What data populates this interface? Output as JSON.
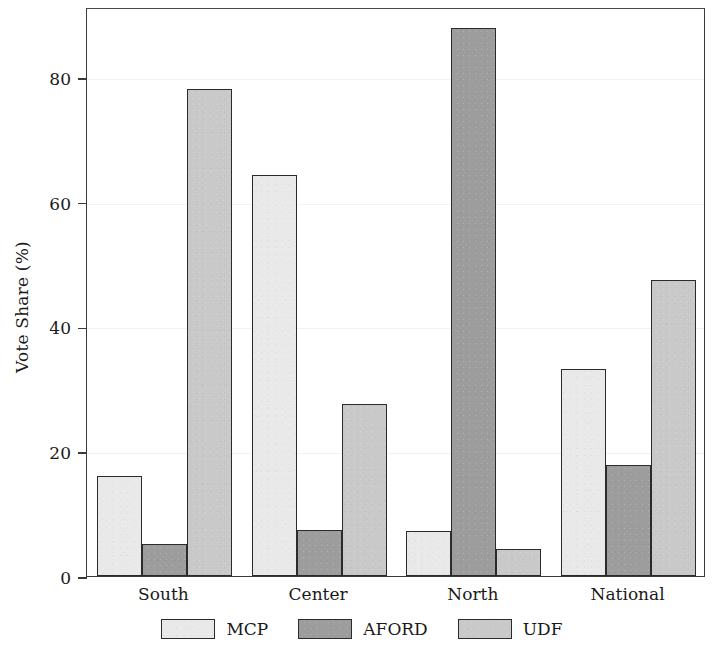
{
  "chart_data": {
    "type": "bar",
    "title": "",
    "xlabel": "",
    "ylabel": "Vote Share (%)",
    "categories": [
      "South",
      "Center",
      "North",
      "National"
    ],
    "series": [
      {
        "name": "MCP",
        "color": "#e9e9e9",
        "values": [
          16.0,
          64.2,
          7.2,
          33.2
        ]
      },
      {
        "name": "AFORD",
        "color": "#9d9d9d",
        "values": [
          5.1,
          7.4,
          87.8,
          17.8
        ]
      },
      {
        "name": "UDF",
        "color": "#c9c9c9",
        "values": [
          78.0,
          27.6,
          4.3,
          47.5
        ]
      }
    ],
    "ylim": [
      0,
      91.2
    ],
    "yticks": [
      0,
      20,
      40,
      60,
      80
    ],
    "ytick_labels": [
      "0",
      "20",
      "40",
      "60",
      "80"
    ],
    "grid": true,
    "legend_position": "bottom",
    "axis_color": "#3a3a3a",
    "bar_edge_color": "#2b2b2b"
  }
}
